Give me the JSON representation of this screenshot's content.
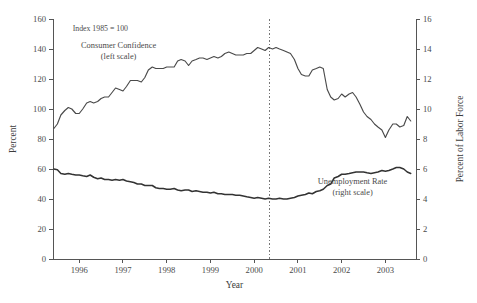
{
  "chart_data": {
    "type": "line",
    "title": "",
    "xlabel": "Year",
    "ylabel": "Percent",
    "ylabel_right": "Percent of Labor Force",
    "xlim": [
      1995.4,
      2003.7
    ],
    "ylim": [
      0,
      160
    ],
    "ylim_right": [
      0,
      16
    ],
    "grid": false,
    "legend": "inline-annotations",
    "notes": [
      {
        "text": "Index 1985 = 100",
        "x": 1995.85,
        "y": 152
      }
    ],
    "annotations": [
      {
        "label": "Consumer Confidence",
        "sublabel": "(left scale)",
        "x": 1996.9,
        "y": 141
      },
      {
        "label": "Unemployment Rate",
        "sublabel": "(right scale)",
        "x": 2002.25,
        "y": 50
      }
    ],
    "event_lines": [
      {
        "x": 2000.35,
        "style": "dotted"
      }
    ],
    "xticks": [
      1996,
      1997,
      1998,
      1999,
      2000,
      2001,
      2002,
      2003,
      2004
    ],
    "xtick_labels": [
      "1996",
      "1997",
      "1998",
      "1999",
      "2000",
      "2001",
      "2002",
      "2003",
      "2004"
    ],
    "yticks_left": [
      0,
      20,
      40,
      60,
      80,
      100,
      120,
      140,
      160
    ],
    "ytick_labels_left": [
      "0",
      "20",
      "40",
      "60",
      "80",
      "100",
      "120",
      "140",
      "160"
    ],
    "yticks_right": [
      0,
      2,
      4,
      6,
      8,
      10,
      12,
      14,
      16
    ],
    "ytick_labels_right": [
      "0",
      "2",
      "4",
      "6",
      "8",
      "10",
      "12",
      "14",
      "16"
    ],
    "series": [
      {
        "name": "Consumer Confidence",
        "axis": "left",
        "units": "Index 1985 = 100",
        "x": [
          1995.42,
          1995.5,
          1995.58,
          1995.67,
          1995.75,
          1995.83,
          1995.92,
          1996.0,
          1996.08,
          1996.17,
          1996.25,
          1996.33,
          1996.42,
          1996.5,
          1996.58,
          1996.67,
          1996.75,
          1996.83,
          1996.92,
          1997.0,
          1997.08,
          1997.17,
          1997.25,
          1997.33,
          1997.42,
          1997.5,
          1997.58,
          1997.67,
          1997.75,
          1997.83,
          1997.92,
          1998.0,
          1998.08,
          1998.17,
          1998.25,
          1998.33,
          1998.42,
          1998.5,
          1998.58,
          1998.67,
          1998.75,
          1998.83,
          1998.92,
          1999.0,
          1999.08,
          1999.17,
          1999.25,
          1999.33,
          1999.42,
          1999.5,
          1999.58,
          1999.67,
          1999.75,
          1999.83,
          1999.92,
          2000.0,
          2000.08,
          2000.17,
          2000.25,
          2000.33,
          2000.42,
          2000.5,
          2000.58,
          2000.67,
          2000.75,
          2000.83,
          2000.92,
          2001.0,
          2001.08,
          2001.17,
          2001.25,
          2001.33,
          2001.42,
          2001.5,
          2001.58,
          2001.67,
          2001.75,
          2001.83,
          2001.92,
          2002.0,
          2002.08,
          2002.17,
          2002.25,
          2002.33,
          2002.42,
          2002.5,
          2002.58,
          2002.67,
          2002.75,
          2002.83,
          2002.92,
          2003.0,
          2003.08,
          2003.17,
          2003.25,
          2003.33,
          2003.42,
          2003.5,
          2003.58
        ],
        "values": [
          87,
          90,
          96,
          99,
          101,
          100,
          97,
          97,
          100,
          104,
          105,
          104,
          105,
          107,
          108,
          108,
          111,
          114,
          113,
          112,
          115,
          119,
          119,
          119,
          118,
          121,
          126,
          128,
          127,
          127,
          127,
          128,
          128,
          128,
          132,
          133,
          132,
          129,
          132,
          133,
          134,
          134,
          133,
          134,
          135,
          134,
          135,
          137,
          138,
          137,
          136,
          136,
          136,
          137,
          137,
          139,
          141,
          140,
          139,
          141,
          140,
          141,
          140,
          139,
          138,
          137,
          133,
          127,
          123,
          122,
          122,
          126,
          127,
          128,
          127,
          113,
          108,
          106,
          107,
          110,
          108,
          110,
          111,
          108,
          103,
          98,
          95,
          93,
          90,
          88,
          86,
          81,
          86,
          90,
          90,
          88,
          89,
          95,
          92
        ]
      },
      {
        "name": "Unemployment Rate",
        "axis": "right",
        "units": "Percent of Labor Force",
        "x": [
          1995.42,
          1995.5,
          1995.58,
          1995.67,
          1995.75,
          1995.83,
          1995.92,
          1996.0,
          1996.08,
          1996.17,
          1996.25,
          1996.33,
          1996.42,
          1996.5,
          1996.58,
          1996.67,
          1996.75,
          1996.83,
          1996.92,
          1997.0,
          1997.08,
          1997.17,
          1997.25,
          1997.33,
          1997.42,
          1997.5,
          1997.58,
          1997.67,
          1997.75,
          1997.83,
          1997.92,
          1998.0,
          1998.08,
          1998.17,
          1998.25,
          1998.33,
          1998.42,
          1998.5,
          1998.58,
          1998.67,
          1998.75,
          1998.83,
          1998.92,
          1999.0,
          1999.08,
          1999.17,
          1999.25,
          1999.33,
          1999.42,
          1999.5,
          1999.58,
          1999.67,
          1999.75,
          1999.83,
          1999.92,
          2000.0,
          2000.08,
          2000.17,
          2000.25,
          2000.33,
          2000.42,
          2000.5,
          2000.58,
          2000.67,
          2000.75,
          2000.83,
          2000.92,
          2001.0,
          2001.08,
          2001.17,
          2001.25,
          2001.33,
          2001.42,
          2001.5,
          2001.58,
          2001.67,
          2001.75,
          2001.83,
          2001.92,
          2002.0,
          2002.08,
          2002.17,
          2002.25,
          2002.33,
          2002.42,
          2002.5,
          2002.58,
          2002.67,
          2002.75,
          2002.83,
          2002.92,
          2003.0,
          2003.08,
          2003.17,
          2003.25,
          2003.33,
          2003.42,
          2003.5,
          2003.58
        ],
        "values": [
          6.0,
          5.95,
          5.7,
          5.65,
          5.7,
          5.65,
          5.6,
          5.6,
          5.55,
          5.5,
          5.6,
          5.45,
          5.35,
          5.4,
          5.3,
          5.3,
          5.25,
          5.3,
          5.25,
          5.3,
          5.2,
          5.15,
          5.1,
          5.0,
          5.0,
          4.9,
          4.9,
          4.9,
          4.75,
          4.7,
          4.7,
          4.65,
          4.65,
          4.7,
          4.6,
          4.55,
          4.6,
          4.6,
          4.5,
          4.55,
          4.5,
          4.45,
          4.45,
          4.4,
          4.45,
          4.35,
          4.35,
          4.3,
          4.3,
          4.3,
          4.25,
          4.25,
          4.2,
          4.15,
          4.1,
          4.05,
          4.1,
          4.05,
          4.0,
          4.05,
          4.0,
          4.0,
          4.05,
          4.0,
          4.0,
          4.05,
          4.1,
          4.2,
          4.25,
          4.3,
          4.4,
          4.35,
          4.5,
          4.55,
          4.65,
          4.9,
          5.0,
          5.4,
          5.5,
          5.65,
          5.65,
          5.7,
          5.75,
          5.8,
          5.8,
          5.8,
          5.75,
          5.7,
          5.75,
          5.8,
          5.9,
          5.85,
          5.9,
          6.0,
          6.1,
          6.1,
          6.0,
          5.8,
          5.7
        ]
      }
    ]
  },
  "colors": {
    "background": "#ffffff",
    "axis": "#555555",
    "series_confidence": "#4a4a4a",
    "series_unemployment": "#333333",
    "text": "#444444",
    "event_line": "#777777"
  }
}
